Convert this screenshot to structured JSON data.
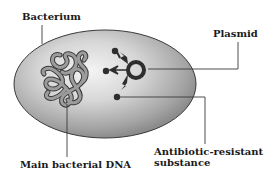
{
  "diagram": {
    "labels": {
      "bacterium": "Bacterium",
      "plasmid": "Plasmid",
      "antibiotic_line1": "Antibiotic-resistant",
      "antibiotic_line2": "substance",
      "main_dna": "Main bacterial DNA"
    },
    "colors": {
      "cell_edge": "#3a3a3a",
      "cell_fill_light": "#f2f2f2",
      "cell_fill_dark": "#8a8a8a",
      "dna_fill": "#9a9a9a",
      "dna_outline": "#3a3a3a",
      "plasmid": "#2e2e2e",
      "leader_line": "#3a3a3a",
      "text": "#1a1a1a"
    }
  }
}
